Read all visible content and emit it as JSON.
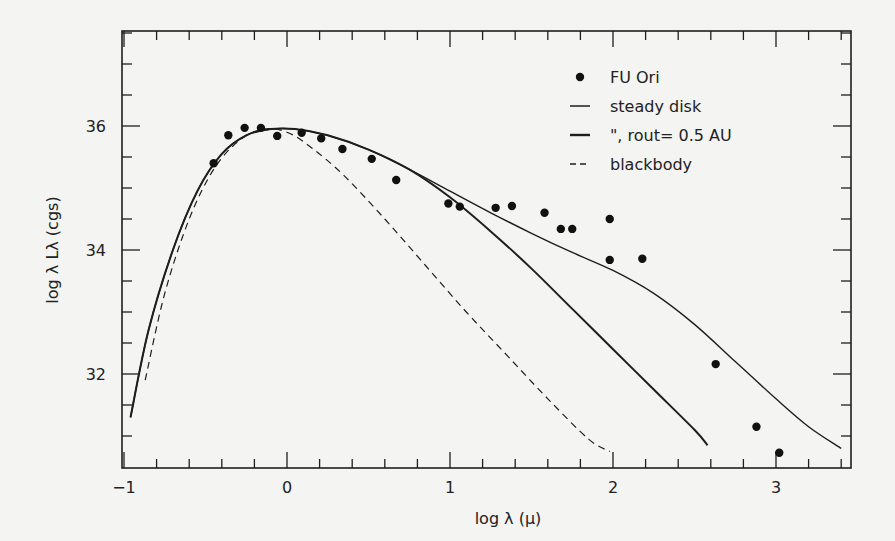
{
  "chart_data": {
    "type": "scatter",
    "title": "",
    "xlabel": "log λ (μ)",
    "ylabel": "log λ L_λ (cgs)",
    "xlim": [
      -1.0,
      3.47
    ],
    "ylim": [
      30.8,
      37.8
    ],
    "x_ticks": [
      -1,
      0,
      1,
      2,
      3
    ],
    "x_tick_labels": [
      "−1",
      "0",
      "1",
      "2",
      "3"
    ],
    "y_ticks": [
      32,
      34,
      36
    ],
    "y_tick_labels": [
      "32",
      "34",
      "36"
    ],
    "grid": false,
    "legend_position": "upper right (inside)",
    "legend": [
      {
        "marker": "dot",
        "label": "FU Ori"
      },
      {
        "marker": "thin-line",
        "label": "steady disk"
      },
      {
        "marker": "thick-line",
        "label": "\", rout= 0.5 AU"
      },
      {
        "marker": "dashed-line",
        "label": "blackbody"
      }
    ],
    "series": [
      {
        "name": "FU Ori",
        "style": "points",
        "x": [
          -0.45,
          -0.36,
          -0.26,
          -0.16,
          -0.06,
          0.09,
          0.21,
          0.34,
          0.52,
          0.67,
          0.99,
          1.06,
          1.28,
          1.38,
          1.58,
          1.68,
          1.75,
          1.98,
          1.98,
          2.18,
          2.63,
          2.88,
          3.02
        ],
        "y": [
          35.4,
          35.85,
          35.97,
          35.97,
          35.84,
          35.89,
          35.8,
          35.63,
          35.47,
          35.13,
          34.75,
          34.7,
          34.68,
          34.71,
          34.6,
          34.34,
          34.34,
          34.5,
          33.84,
          33.86,
          32.16,
          31.15,
          30.73
        ]
      },
      {
        "name": "steady disk",
        "style": "thin-solid",
        "x": [
          -0.96,
          -0.85,
          -0.7,
          -0.55,
          -0.4,
          -0.25,
          -0.1,
          0.05,
          0.25,
          0.5,
          0.75,
          1.0,
          1.25,
          1.5,
          1.75,
          2.0,
          2.25,
          2.5,
          2.75,
          3.0,
          3.2,
          3.4
        ],
        "y": [
          31.3,
          32.7,
          34.0,
          34.95,
          35.55,
          35.85,
          35.95,
          35.95,
          35.85,
          35.62,
          35.3,
          34.95,
          34.6,
          34.27,
          33.96,
          33.67,
          33.3,
          32.8,
          32.2,
          31.6,
          31.15,
          30.8
        ]
      },
      {
        "name": "rout = 0.5 AU",
        "style": "thick-solid",
        "x": [
          -0.96,
          -0.85,
          -0.7,
          -0.55,
          -0.4,
          -0.25,
          -0.1,
          0.05,
          0.25,
          0.5,
          0.75,
          1.0,
          1.25,
          1.5,
          1.75,
          2.0,
          2.25,
          2.5,
          2.58
        ],
        "y": [
          31.3,
          32.7,
          34.0,
          34.95,
          35.55,
          35.85,
          35.95,
          35.95,
          35.85,
          35.62,
          35.3,
          34.85,
          34.3,
          33.7,
          33.05,
          32.4,
          31.75,
          31.1,
          30.85
        ]
      },
      {
        "name": "blackbody",
        "style": "dashed",
        "x": [
          -0.87,
          -0.75,
          -0.6,
          -0.45,
          -0.3,
          -0.15,
          0.0,
          0.15,
          0.35,
          0.6,
          0.85,
          1.1,
          1.35,
          1.6,
          1.85,
          1.98
        ],
        "y": [
          31.9,
          33.3,
          34.5,
          35.3,
          35.75,
          35.95,
          35.9,
          35.65,
          35.2,
          34.5,
          33.75,
          33.0,
          32.3,
          31.6,
          30.95,
          30.75
        ]
      }
    ]
  }
}
